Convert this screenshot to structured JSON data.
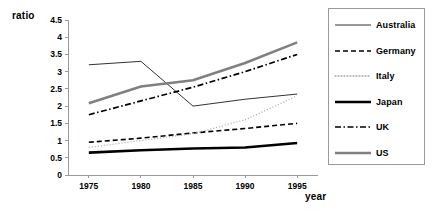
{
  "chart_data": {
    "type": "line",
    "title": "",
    "xlabel": "year",
    "ylabel": "ratio",
    "x": [
      1975,
      1980,
      1985,
      1990,
      1995
    ],
    "xtick_labels": [
      "1975",
      "1980",
      "1985",
      "1990",
      "1995"
    ],
    "ytick_labels": [
      "0",
      "0.5",
      "1",
      "1.5",
      "2",
      "2.5",
      "3",
      "3.5",
      "4",
      "4.5"
    ],
    "ytick_values": [
      0,
      0.5,
      1,
      1.5,
      2,
      2.5,
      3,
      3.5,
      4,
      4.5
    ],
    "ylim": [
      0,
      4.5
    ],
    "xlim": [
      1973,
      1997
    ],
    "grid": false,
    "legend_position": "right",
    "series": [
      {
        "name": "Australia",
        "values": [
          3.2,
          3.3,
          2.0,
          2.2,
          2.35
        ],
        "color": "#333333",
        "style": "solid",
        "width": 1
      },
      {
        "name": "Germany",
        "values": [
          0.95,
          1.07,
          1.22,
          1.35,
          1.5
        ],
        "color": "#000000",
        "style": "dashed",
        "width": 1.6
      },
      {
        "name": "Italy",
        "values": [
          0.8,
          1.0,
          1.2,
          1.6,
          2.3
        ],
        "color": "#aaaaaa",
        "style": "dotted",
        "width": 1.3
      },
      {
        "name": "Japan",
        "values": [
          0.65,
          0.72,
          0.77,
          0.8,
          0.93
        ],
        "color": "#000000",
        "style": "solid",
        "width": 2.6
      },
      {
        "name": "UK",
        "values": [
          1.75,
          2.15,
          2.55,
          3.0,
          3.5
        ],
        "color": "#000000",
        "style": "dashdot",
        "width": 1.7
      },
      {
        "name": "US",
        "values": [
          2.08,
          2.57,
          2.75,
          3.25,
          3.85
        ],
        "color": "#808080",
        "style": "solid",
        "width": 2.6
      }
    ]
  },
  "legend": {
    "items": [
      {
        "label": "Australia"
      },
      {
        "label": "Germany"
      },
      {
        "label": "Italy"
      },
      {
        "label": "Japan"
      },
      {
        "label": "UK"
      },
      {
        "label": "US"
      }
    ]
  },
  "colors": {
    "axis": "#9a9a9a",
    "text": "#000000",
    "background": "#ffffff",
    "legend_border": "#9a9a9a"
  }
}
